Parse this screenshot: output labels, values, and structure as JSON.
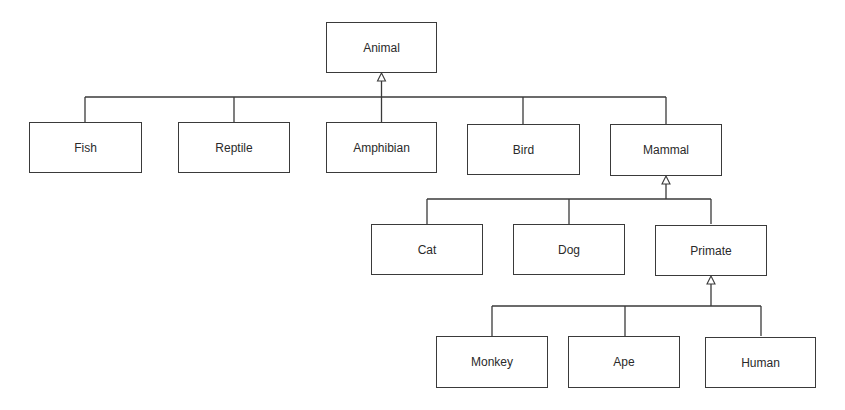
{
  "diagram": {
    "type": "uml-class-hierarchy",
    "relationship": "generalization (inheritance)",
    "colors": {
      "stroke": "#3a3a3a",
      "text": "#2a2a2a",
      "background": "#ffffff"
    },
    "nodes": {
      "animal": {
        "label": "Animal",
        "parent": null
      },
      "fish": {
        "label": "Fish",
        "parent": "Animal"
      },
      "reptile": {
        "label": "Reptile",
        "parent": "Animal"
      },
      "amphibian": {
        "label": "Amphibian",
        "parent": "Animal"
      },
      "bird": {
        "label": "Bird",
        "parent": "Animal"
      },
      "mammal": {
        "label": "Mammal",
        "parent": "Animal"
      },
      "cat": {
        "label": "Cat",
        "parent": "Mammal"
      },
      "dog": {
        "label": "Dog",
        "parent": "Mammal"
      },
      "primate": {
        "label": "Primate",
        "parent": "Mammal"
      },
      "monkey": {
        "label": "Monkey",
        "parent": "Primate"
      },
      "ape": {
        "label": "Ape",
        "parent": "Primate"
      },
      "human": {
        "label": "Human",
        "parent": "Primate"
      }
    },
    "levels": [
      [
        "Animal"
      ],
      [
        "Fish",
        "Reptile",
        "Amphibian",
        "Bird",
        "Mammal"
      ],
      [
        "Cat",
        "Dog",
        "Primate"
      ],
      [
        "Monkey",
        "Ape",
        "Human"
      ]
    ]
  }
}
